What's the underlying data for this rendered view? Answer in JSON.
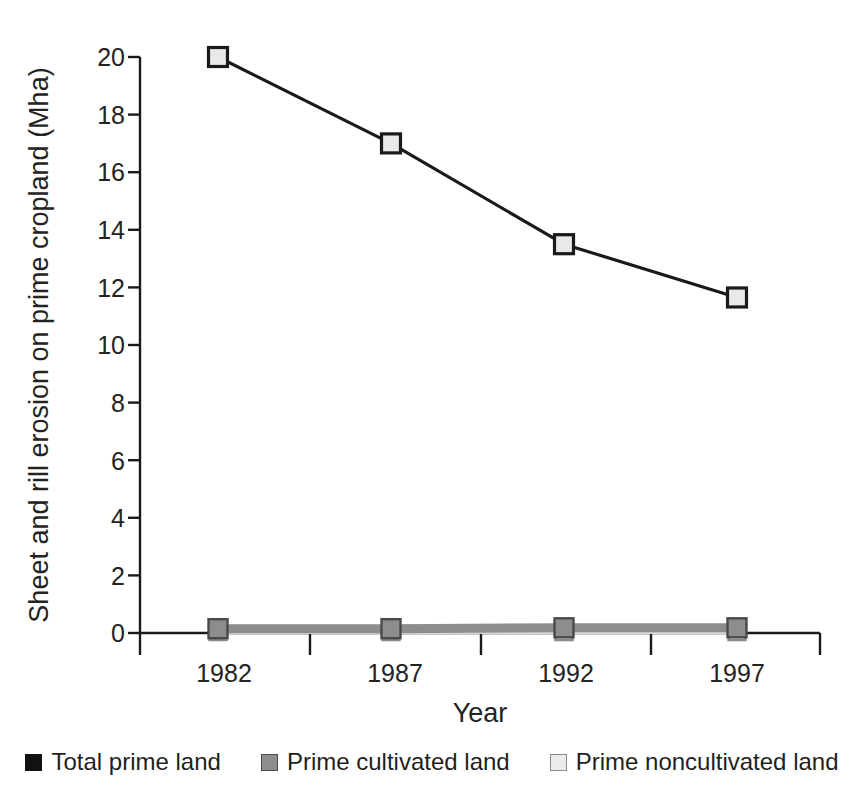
{
  "chart_data": {
    "type": "line",
    "title": "",
    "xlabel": "Year",
    "ylabel": "Sheet and rill erosion on prime cropland (Mha)",
    "categories": [
      "1982",
      "1987",
      "1992",
      "1997"
    ],
    "x": [
      1982,
      1987,
      1992,
      1997
    ],
    "xlim": [
      1979.5,
      2000.5
    ],
    "ylim": [
      0,
      20
    ],
    "yticks": [
      "0",
      "2",
      "4",
      "6",
      "8",
      "10",
      "12",
      "14",
      "16",
      "18",
      "20"
    ],
    "ytick_values": [
      0,
      2,
      4,
      6,
      8,
      10,
      12,
      14,
      16,
      18,
      20
    ],
    "grid": false,
    "legend_position": "bottom",
    "series": [
      {
        "name": "Total prime land",
        "values": [
          20.0,
          17.0,
          13.5,
          11.65
        ],
        "line_color": "#1a1a1a",
        "marker": "square",
        "marker_fill": "#e9e9e9",
        "marker_edge": "#1a1a1a"
      },
      {
        "name": "Prime cultivated land",
        "values": [
          0.15,
          0.15,
          0.18,
          0.18
        ],
        "line_color": "#8d8d8d",
        "marker": "square",
        "marker_fill": "#8d8d8d",
        "marker_edge": "#4a4a4a"
      },
      {
        "name": "Prime noncultivated land",
        "values": [
          0.05,
          0.05,
          0.05,
          0.05
        ],
        "line_color": "#d8d8d8",
        "marker": "square",
        "marker_fill": "#ebebeb",
        "marker_edge": "#8a8a8a"
      }
    ]
  },
  "axes": {
    "y_title": "Sheet and rill erosion on prime cropland (Mha)",
    "x_title": "Year",
    "y_tick_labels": [
      "20",
      "18",
      "16",
      "14",
      "12",
      "10",
      "8",
      "6",
      "4",
      "2",
      "0"
    ],
    "x_tick_labels": [
      "1982",
      "1987",
      "1992",
      "1997"
    ]
  },
  "legend": {
    "items": [
      {
        "label": "Total prime land",
        "swatch": "black-square-icon"
      },
      {
        "label": "Prime cultivated land",
        "swatch": "gray-square-icon"
      },
      {
        "label": "Prime noncultivated land",
        "swatch": "light-square-icon"
      }
    ]
  },
  "colors": {
    "axis": "#1a1a1a",
    "total_prime_line": "#1a1a1a",
    "cultivated_line": "#8d8d8d",
    "noncultivated_line": "#d8d8d8",
    "background": "#ffffff"
  }
}
